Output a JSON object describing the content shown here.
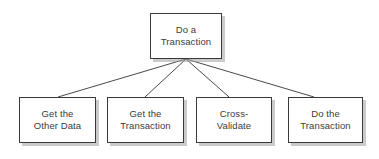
{
  "diagram": {
    "type": "tree",
    "background_color": "#ffffff",
    "box_fill_color": "#ffffff",
    "box_border_color": "#3a3a3a",
    "box_shadow_color": "#a0a0a0",
    "text_color": "#3b3b3b",
    "connector_color": "#4a4a4a",
    "root": {
      "label": "Do a\nTransaction"
    },
    "children": [
      {
        "label": "Get the\nOther Data"
      },
      {
        "label": "Get the\nTransaction"
      },
      {
        "label": "Cross-\nValidate"
      },
      {
        "label": "Do the\nTransaction"
      }
    ],
    "connectors": [
      {
        "from": "root",
        "to": "child-0"
      },
      {
        "from": "root",
        "to": "child-1"
      },
      {
        "from": "root",
        "to": "child-2"
      },
      {
        "from": "root",
        "to": "child-3"
      }
    ]
  }
}
